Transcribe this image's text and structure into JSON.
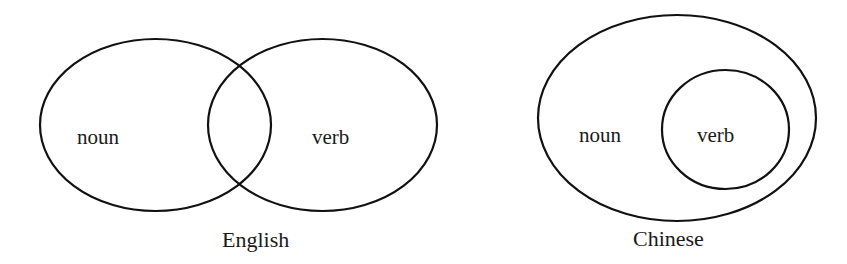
{
  "diagrams": {
    "english": {
      "caption": "English",
      "sets": [
        {
          "label": "noun"
        },
        {
          "label": "verb"
        }
      ],
      "relation": "overlapping"
    },
    "chinese": {
      "caption": "Chinese",
      "sets": [
        {
          "label": "noun"
        },
        {
          "label": "verb"
        }
      ],
      "relation": "verb contained within noun"
    }
  },
  "colors": {
    "stroke": "#111111",
    "text": "#1a1a1a",
    "background": "#ffffff"
  }
}
